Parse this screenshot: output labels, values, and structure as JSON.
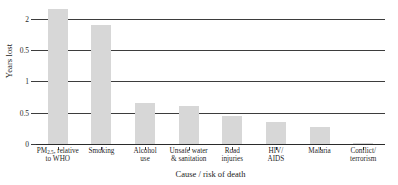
{
  "chart_data": {
    "type": "bar",
    "title": "",
    "xlabel": "Cause / risk of death",
    "ylabel": "Years lost",
    "ylim": [
      0,
      2.25
    ],
    "grid": true,
    "legend": null,
    "ytick_labels": [
      "2",
      "0.5",
      "1",
      "0.5",
      "0"
    ],
    "ytick_values": [
      2,
      1.5,
      1,
      0.5,
      0
    ],
    "categories": [
      "PM2.5, relative to WHO",
      "Smoking",
      "Alcohol use",
      "Unsafe water & sanitation",
      "Road injuries",
      "HIV/AIDS",
      "Malaria",
      "Conflict/terrorism"
    ],
    "category_lines": [
      [
        "PM",
        "2.5",
        ", relative",
        "to WHO"
      ],
      [
        "Smoking"
      ],
      [
        "Alcohol",
        "use"
      ],
      [
        "Unsafe water",
        "& sanitation"
      ],
      [
        "Road",
        "injuries"
      ],
      [
        "HIV/",
        "AIDS"
      ],
      [
        "Malaria"
      ],
      [
        "Conflict/",
        "terrorism"
      ]
    ],
    "values": [
      2.15,
      1.9,
      0.65,
      0.6,
      0.45,
      0.35,
      0.27,
      0.02
    ],
    "bar_color": "#d7d7d7",
    "axis_color": "#3d3d3d"
  },
  "source_note": ""
}
